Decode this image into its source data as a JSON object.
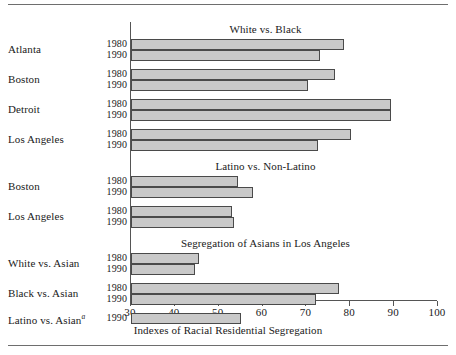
{
  "figure": {
    "axis_title": "Indexes of Racial Residential Segregation",
    "footnote_marker": "a",
    "bar_fill_color": "#c9c9c9",
    "bar_border_color": "#4a4a4a",
    "axis_color": "#555555",
    "rule_color": "#6e6e6e"
  },
  "chart_data": {
    "type": "bar",
    "orientation": "horizontal",
    "title": "",
    "xlabel": "Indexes of Racial Residential Segregation",
    "ylabel": "",
    "xlim": [
      30,
      100
    ],
    "xticks": [
      30,
      40,
      50,
      60,
      70,
      80,
      90,
      100
    ],
    "xtick_labels": [
      "30",
      "40",
      "50",
      "60",
      "70",
      "80",
      "90",
      "100"
    ],
    "grid": false,
    "legend": "none",
    "series": [
      {
        "name": "1980",
        "year": "1980"
      },
      {
        "name": "1990",
        "year": "1990"
      }
    ],
    "sections": [
      {
        "header": "White vs. Black",
        "groups": [
          {
            "label": "Atlanta",
            "bars": [
              {
                "year": "1980",
                "value": 78.6
              },
              {
                "year": "1990",
                "value": 73.1
              }
            ]
          },
          {
            "label": "Boston",
            "bars": [
              {
                "year": "1980",
                "value": 76.5
              },
              {
                "year": "1990",
                "value": 70.3
              }
            ]
          },
          {
            "label": "Detroit",
            "bars": [
              {
                "year": "1980",
                "value": 89.3
              },
              {
                "year": "1990",
                "value": 89.3
              }
            ]
          },
          {
            "label": "Los Angeles",
            "bars": [
              {
                "year": "1980",
                "value": 80.2
              },
              {
                "year": "1990",
                "value": 72.6
              }
            ]
          }
        ]
      },
      {
        "header": "Latino vs. Non-Latino",
        "groups": [
          {
            "label": "Boston",
            "bars": [
              {
                "year": "1980",
                "value": 54.4
              },
              {
                "year": "1990",
                "value": 57.8
              }
            ]
          },
          {
            "label": "Los Angeles",
            "bars": [
              {
                "year": "1980",
                "value": 53.0
              },
              {
                "year": "1990",
                "value": 53.5
              }
            ]
          }
        ]
      },
      {
        "header": "Segregation of Asians in Los Angeles",
        "groups": [
          {
            "label": "White vs. Asian",
            "bars": [
              {
                "year": "1980",
                "value": 45.5
              },
              {
                "year": "1990",
                "value": 44.6
              }
            ]
          },
          {
            "label": "Black vs. Asian",
            "bars": [
              {
                "year": "1980",
                "value": 77.4
              },
              {
                "year": "1990",
                "value": 72.2
              }
            ]
          },
          {
            "label": "Latino vs. Asian",
            "label_superscript": "a",
            "bars": [
              {
                "year": "1990",
                "value": 55.1
              }
            ]
          }
        ]
      }
    ]
  }
}
